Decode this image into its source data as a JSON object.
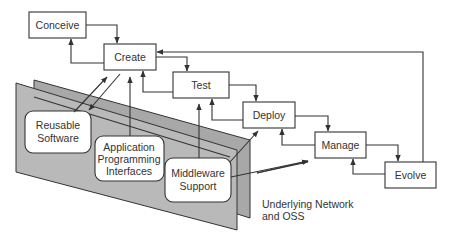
{
  "diagram": {
    "lifecycle_stages": [
      {
        "id": "conceive",
        "label": "Conceive"
      },
      {
        "id": "create",
        "label": "Create"
      },
      {
        "id": "test",
        "label": "Test"
      },
      {
        "id": "deploy",
        "label": "Deploy"
      },
      {
        "id": "manage",
        "label": "Manage"
      },
      {
        "id": "evolve",
        "label": "Evolve"
      }
    ],
    "components": [
      {
        "id": "reusable",
        "lines": [
          "Reusable",
          "Software"
        ]
      },
      {
        "id": "api",
        "lines": [
          "Application",
          "Programming",
          "Interfaces"
        ]
      },
      {
        "id": "middleware",
        "lines": [
          "Middleware",
          "Support"
        ]
      }
    ],
    "platform_label": [
      "Underlying Network",
      "and OSS"
    ],
    "colors": {
      "stroke": "#333333",
      "plane_front": "#b9b9b9",
      "plane_back": "#a8a8a8",
      "box_fill": "#ffffff"
    }
  }
}
